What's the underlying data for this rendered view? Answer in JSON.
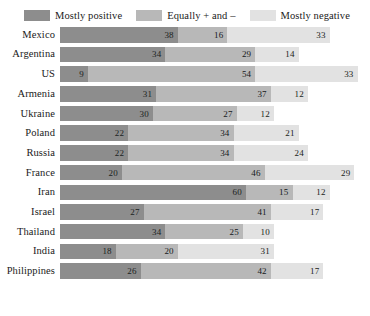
{
  "legend": {
    "items": [
      {
        "label": "Mostly positive",
        "color": "#8d8d8d",
        "key": "positive"
      },
      {
        "label": "Equally + and –",
        "color": "#b8b8b8",
        "key": "equal"
      },
      {
        "label": "Mostly negative",
        "color": "#e2e2e2",
        "key": "negative"
      }
    ]
  },
  "chart_data": {
    "type": "bar",
    "orientation": "horizontal",
    "stacked": true,
    "title": "",
    "subtitle": "",
    "xlabel": "",
    "ylabel": "",
    "xlim": [
      0,
      100
    ],
    "grid": false,
    "legend_position": "top-center",
    "value_unit": "percent",
    "categories": [
      "Mexico",
      "Argentina",
      "US",
      "Armenia",
      "Ukraine",
      "Poland",
      "Russia",
      "France",
      "Iran",
      "Israel",
      "Thailand",
      "India",
      "Philippines"
    ],
    "series": [
      {
        "name": "Mostly positive",
        "color": "#8d8d8d",
        "values": [
          38,
          34,
          9,
          31,
          30,
          22,
          22,
          20,
          60,
          27,
          34,
          18,
          26
        ]
      },
      {
        "name": "Equally + and –",
        "color": "#b8b8b8",
        "values": [
          16,
          29,
          54,
          37,
          27,
          34,
          34,
          46,
          15,
          41,
          25,
          20,
          42
        ]
      },
      {
        "name": "Mostly negative",
        "color": "#e2e2e2",
        "values": [
          33,
          14,
          33,
          12,
          12,
          21,
          24,
          29,
          12,
          17,
          10,
          31,
          17
        ]
      }
    ],
    "rows": [
      {
        "category": "Mexico",
        "positive": 38,
        "equal": 16,
        "negative": 33
      },
      {
        "category": "Argentina",
        "positive": 34,
        "equal": 29,
        "negative": 14
      },
      {
        "category": "US",
        "positive": 9,
        "equal": 54,
        "negative": 33
      },
      {
        "category": "Armenia",
        "positive": 31,
        "equal": 37,
        "negative": 12
      },
      {
        "category": "Ukraine",
        "positive": 30,
        "equal": 27,
        "negative": 12
      },
      {
        "category": "Poland",
        "positive": 22,
        "equal": 34,
        "negative": 21
      },
      {
        "category": "Russia",
        "positive": 22,
        "equal": 34,
        "negative": 24
      },
      {
        "category": "France",
        "positive": 20,
        "equal": 46,
        "negative": 29
      },
      {
        "category": "Iran",
        "positive": 60,
        "equal": 15,
        "negative": 12
      },
      {
        "category": "Israel",
        "positive": 27,
        "equal": 41,
        "negative": 17
      },
      {
        "category": "Thailand",
        "positive": 34,
        "equal": 25,
        "negative": 10
      },
      {
        "category": "India",
        "positive": 18,
        "equal": 20,
        "negative": 31
      },
      {
        "category": "Philippines",
        "positive": 26,
        "equal": 42,
        "negative": 17
      }
    ]
  }
}
